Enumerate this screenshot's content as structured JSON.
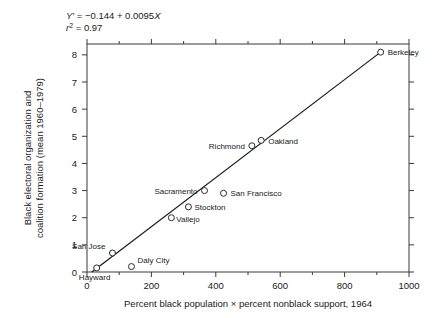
{
  "chart_data": {
    "type": "scatter",
    "title": "",
    "xlabel": "Percent black population × percent nonblack support, 1964",
    "ylabel_line1": "Black electoral organization and",
    "ylabel_line2": "coalition formation (mean 1960–1979)",
    "xlim": [
      0,
      1000
    ],
    "ylim": [
      0,
      8.4
    ],
    "xticks": [
      0,
      200,
      400,
      600,
      800,
      1000
    ],
    "xtick_labels": [
      "0",
      "200",
      "400",
      "600",
      "800",
      "1000"
    ],
    "xminor_ticks": [
      100,
      300,
      500,
      700,
      900
    ],
    "yticks": [
      0,
      1,
      2,
      3,
      4,
      5,
      6,
      7,
      8
    ],
    "ytick_labels": [
      "0",
      "1",
      "2",
      "3",
      "4",
      "5",
      "6",
      "7",
      "8"
    ],
    "grid": false,
    "legend": "none",
    "marker_style": "open-circle",
    "annotations": {
      "equation": "Y′ = −0.144 + 0.0095X",
      "r_squared": "r² = 0.97",
      "equation_slope": 0.0095,
      "equation_intercept": -0.144,
      "r_squared_value": 0.97
    },
    "fit_line": {
      "x_start": 15,
      "x_end": 912,
      "y_start": 0.0,
      "y_end": 8.1
    },
    "points": [
      {
        "name": "Hayward",
        "x": 30,
        "y": 0.15,
        "label_dx": -2,
        "label_dy": 12,
        "anchor": "middle"
      },
      {
        "name": "Daly City",
        "x": 138,
        "y": 0.2,
        "label_dx": 6,
        "label_dy": -4,
        "anchor": "start"
      },
      {
        "name": "San Jose",
        "x": 79,
        "y": 0.7,
        "label_dx": -7,
        "label_dy": -4,
        "anchor": "end"
      },
      {
        "name": "Vallejo",
        "x": 262,
        "y": 2.0,
        "label_dx": 5,
        "label_dy": 4,
        "anchor": "start"
      },
      {
        "name": "Stockton",
        "x": 315,
        "y": 2.4,
        "label_dx": 6,
        "label_dy": 3,
        "anchor": "start"
      },
      {
        "name": "Sacramento",
        "x": 365,
        "y": 3.0,
        "label_dx": -7,
        "label_dy": 3,
        "anchor": "end"
      },
      {
        "name": "San Francisco",
        "x": 424,
        "y": 2.9,
        "label_dx": 7,
        "label_dy": 3,
        "anchor": "start"
      },
      {
        "name": "Richmond",
        "x": 512,
        "y": 4.65,
        "label_dx": -7,
        "label_dy": 3,
        "anchor": "end"
      },
      {
        "name": "Oakland",
        "x": 541,
        "y": 4.85,
        "label_dx": 7,
        "label_dy": 4,
        "anchor": "start"
      },
      {
        "name": "Berkeley",
        "x": 912,
        "y": 8.1,
        "label_dx": 7,
        "label_dy": 3,
        "anchor": "start"
      }
    ]
  }
}
